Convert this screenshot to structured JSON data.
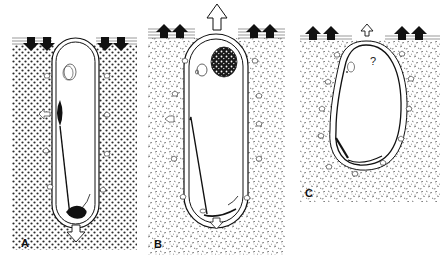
{
  "figure": {
    "colors": {
      "ink": "#111111",
      "paper": "#ffffff",
      "sediment_dot": "#2a2a2a"
    }
  },
  "panels": [
    {
      "id": "A",
      "label": "A",
      "sediment": "coarse-dotted",
      "top_arrows": "solid-down",
      "center_arrow": "none",
      "bottom_arrow": "hollow-down",
      "inner_mark": ""
    },
    {
      "id": "B",
      "label": "B",
      "sediment": "fine-speckled",
      "top_arrows": "solid-up",
      "center_arrow": "hollow-up-large",
      "bottom_arrow": "hollow-down-small",
      "inner_mark": ""
    },
    {
      "id": "C",
      "label": "C",
      "sediment": "fine-speckled",
      "top_arrows": "solid-up",
      "center_arrow": "hollow-up-small",
      "bottom_arrow": "none",
      "inner_mark": "?"
    }
  ]
}
